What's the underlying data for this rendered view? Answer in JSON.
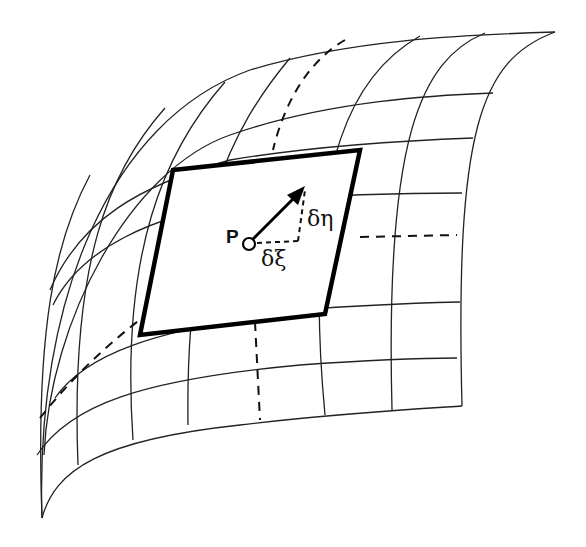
{
  "figure": {
    "labels": {
      "point": "P",
      "component_xi": "δξ",
      "component_eta": "δη"
    },
    "colors": {
      "line": "#222222",
      "plane_border": "#000000",
      "background": "#ffffff"
    }
  }
}
